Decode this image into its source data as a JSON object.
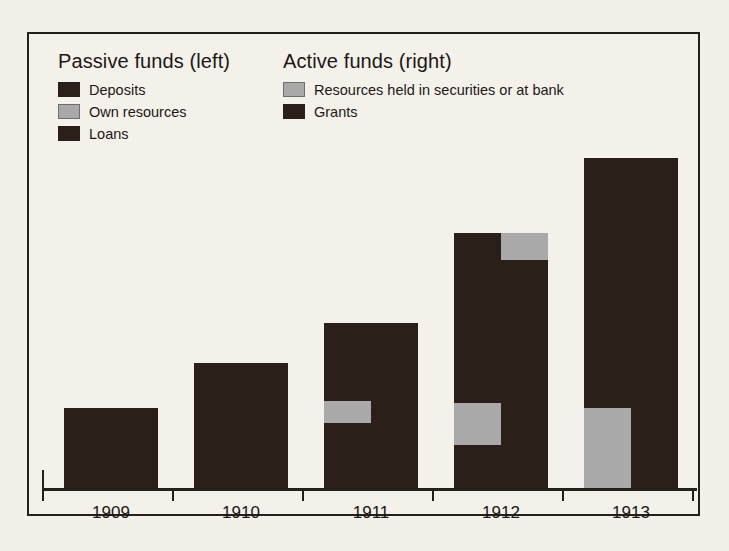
{
  "chart_data": {
    "type": "bar",
    "title": "",
    "subtitle": "",
    "xlabel": "",
    "ylabel": "",
    "grid": false,
    "legend_position": "top-inside",
    "orientation": "vertical",
    "bar_mode": "paired-stacked",
    "categories": [
      "1909",
      "1910",
      "1911",
      "1912",
      "1913"
    ],
    "axis_note": "No numeric y-axis ticks or labels are printed; values are relative bar heights in pixels.",
    "ylim": [
      0,
      330
    ],
    "groups": [
      {
        "category": "1909",
        "bars": [
          {
            "name": "Passive funds (left)",
            "total": 80,
            "segments": [
              {
                "label": "Deposits",
                "value": 80,
                "fill": "dark"
              }
            ]
          },
          {
            "name": "Active funds (right)",
            "total": 80,
            "segments": [
              {
                "label": "Grants",
                "value": 80,
                "fill": "dark"
              }
            ]
          }
        ]
      },
      {
        "category": "1910",
        "bars": [
          {
            "name": "Passive funds (left)",
            "total": 125,
            "segments": [
              {
                "label": "Deposits",
                "value": 125,
                "fill": "dark"
              }
            ]
          },
          {
            "name": "Active funds (right)",
            "total": 125,
            "segments": [
              {
                "label": "Grants",
                "value": 125,
                "fill": "dark"
              }
            ]
          }
        ]
      },
      {
        "category": "1911",
        "bars": [
          {
            "name": "Passive funds (left)",
            "total": 165,
            "segments": [
              {
                "label": "Deposits",
                "value": 78,
                "fill": "dark"
              },
              {
                "label": "Own resources",
                "value": 22,
                "fill": "gray"
              },
              {
                "label": "Loans",
                "value": 65,
                "fill": "dark"
              }
            ]
          },
          {
            "name": "Active funds (right)",
            "total": 165,
            "segments": [
              {
                "label": "Grants",
                "value": 165,
                "fill": "dark"
              }
            ]
          }
        ]
      },
      {
        "category": "1912",
        "bars": [
          {
            "name": "Passive funds (left)",
            "total": 255,
            "segments": [
              {
                "label": "Deposits",
                "value": 170,
                "fill": "dark"
              },
              {
                "label": "Own resources",
                "value": 42,
                "fill": "gray"
              },
              {
                "label": "Loans",
                "value": 43,
                "fill": "dark"
              }
            ]
          },
          {
            "name": "Active funds (right)",
            "total": 255,
            "segments": [
              {
                "label": "Resources held in securities or at bank",
                "value": 27,
                "fill": "gray"
              },
              {
                "label": "Grants",
                "value": 228,
                "fill": "dark"
              }
            ]
          }
        ]
      },
      {
        "category": "1913",
        "bars": [
          {
            "name": "Passive funds (left)",
            "total": 330,
            "segments": [
              {
                "label": "Deposits",
                "value": 250,
                "fill": "dark"
              },
              {
                "label": "Own resources",
                "value": 80,
                "fill": "gray"
              }
            ]
          },
          {
            "name": "Active funds (right)",
            "total": 330,
            "segments": [
              {
                "label": "Grants",
                "value": 330,
                "fill": "dark"
              }
            ]
          }
        ]
      }
    ]
  },
  "legend": {
    "passive": {
      "title": "Passive funds (left)",
      "items": [
        {
          "label": "Deposits",
          "fill": "dark",
          "color": "#2b1f1a"
        },
        {
          "label": "Own resources",
          "fill": "gray",
          "color": "#a9a9a9"
        },
        {
          "label": "Loans",
          "fill": "dark",
          "color": "#2b1f1a"
        }
      ]
    },
    "active": {
      "title": "Active funds (right)",
      "items": [
        {
          "label": "Resources held in securities or at bank",
          "fill": "gray",
          "color": "#a9a9a9"
        },
        {
          "label": "Grants",
          "fill": "dark",
          "color": "#2b1f1a"
        }
      ]
    }
  },
  "axis": {
    "tick_labels": [
      "1909",
      "1910",
      "1911",
      "1912",
      "1913"
    ]
  },
  "colors": {
    "dark": "#2b1f1a",
    "gray": "#a9a9a9",
    "frame": "#24201c",
    "background": "#f3f0ea",
    "text": "#1c1815"
  }
}
